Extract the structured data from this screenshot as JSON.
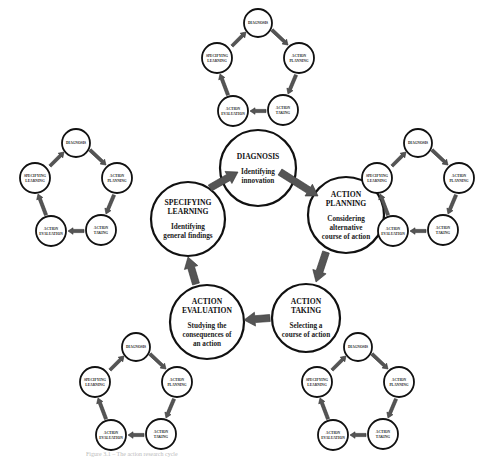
{
  "diagram": {
    "type": "cycle-of-cycles",
    "main_cycle": [
      {
        "id": "diagnosis",
        "title_lines": [
          "DIAGNOSIS"
        ],
        "desc_lines": [
          "Identifying",
          "innovation"
        ]
      },
      {
        "id": "action-planning",
        "title_lines": [
          "ACTION",
          "PLANNING"
        ],
        "desc_lines": [
          "Considering",
          "alternative",
          "course of action"
        ]
      },
      {
        "id": "action-taking",
        "title_lines": [
          "ACTION",
          "TAKING"
        ],
        "desc_lines": [
          "Selecting a",
          "course of action"
        ]
      },
      {
        "id": "action-evaluation",
        "title_lines": [
          "ACTION",
          "EVALUATION"
        ],
        "desc_lines": [
          "Studying the",
          "consequences of",
          "an action"
        ]
      },
      {
        "id": "specifying-learning",
        "title_lines": [
          "SPECIFYING",
          "LEARNING"
        ],
        "desc_lines": [
          "Identifying",
          "general findings"
        ]
      }
    ],
    "sub_cycle_labels": {
      "diagnosis": [
        "DIAGNOSIS"
      ],
      "action_planning": [
        "ACTION",
        "PLANNING"
      ],
      "action_taking": [
        "ACTION",
        "TAKING"
      ],
      "action_evaluation": [
        "ACTION",
        "EVALUATION"
      ],
      "specifying_learning": [
        "SPECIFYING",
        "LEARNING"
      ]
    },
    "sub_cycles": [
      "top",
      "left",
      "right",
      "bottom-left",
      "bottom-right"
    ],
    "caption": "Figure 3.1 – The action research cycle",
    "colors": {
      "stroke": "#111111",
      "arrow_fill": "#555555",
      "background": "#ffffff"
    }
  }
}
